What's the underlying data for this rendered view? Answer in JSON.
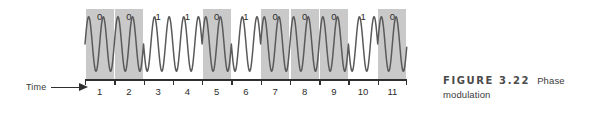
{
  "figure": {
    "caption_number": "FIGURE 3.22",
    "caption_title": "Phase",
    "caption_title_cont": "modulation",
    "axis": {
      "time_label": "Time",
      "time_arrow_icon": "right-arrow-icon"
    }
  },
  "chart_data": {
    "type": "line",
    "title": "Phase modulation",
    "xlabel": "Time",
    "ylabel": "",
    "grid": false,
    "legend": null,
    "categories": [
      "1",
      "2",
      "3",
      "4",
      "5",
      "6",
      "7",
      "8",
      "9",
      "10",
      "11"
    ],
    "bits": [
      "0",
      "0",
      "1",
      "1",
      "0",
      "1",
      "0",
      "0",
      "0",
      "1",
      "0"
    ],
    "shaded_intervals": [
      1,
      2,
      5,
      7,
      8,
      9,
      11
    ],
    "carrier_cycles_per_bit": 2,
    "amplitude": 1.0,
    "phase_for_bit": {
      "0": 0,
      "1": 180
    },
    "x": [
      1,
      2,
      3,
      4,
      5,
      6,
      7,
      8,
      9,
      10,
      11
    ],
    "xlim": [
      0,
      11
    ],
    "ylim": [
      -1,
      1
    ],
    "shade_color": "#c9c9c9",
    "wave_color": "#5a5a5a",
    "axis_color": "#2f2f2f"
  }
}
